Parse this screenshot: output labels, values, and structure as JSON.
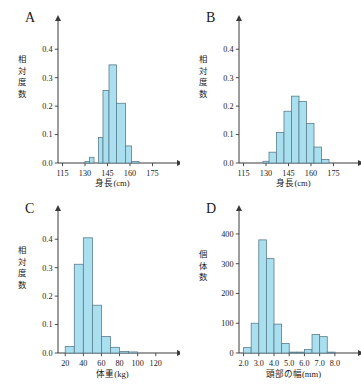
{
  "figure": {
    "background": "#ffffff",
    "bar_fill": "#aadff0",
    "bar_stroke": "#5b7d8c",
    "axis_color": "#3a3a3a"
  },
  "panels": [
    {
      "label": "A",
      "xlabel": "身長(cm)",
      "ylabel": "相対度数",
      "ylabel_chars": [
        "相",
        "対",
        "度",
        "数"
      ],
      "xticks": [
        "115",
        "130",
        "145",
        "160",
        "175"
      ],
      "yticks": [
        "0.0",
        "0.1",
        "0.2",
        "0.3",
        "0.4"
      ]
    },
    {
      "label": "B",
      "xlabel": "身長(cm)",
      "ylabel": "相対度数",
      "ylabel_chars": [
        "相",
        "対",
        "度",
        "数"
      ],
      "xticks": [
        "115",
        "130",
        "145",
        "160",
        "175"
      ],
      "yticks": [
        "0.0",
        "0.1",
        "0.2",
        "0.3",
        "0.4"
      ]
    },
    {
      "label": "C",
      "xlabel": "体重(kg)",
      "ylabel": "相対度数",
      "ylabel_chars": [
        "相",
        "対",
        "度",
        "数"
      ],
      "xticks": [
        "20",
        "40",
        "60",
        "80",
        "100",
        "120"
      ],
      "yticks": [
        "0.0",
        "0.1",
        "0.2",
        "0.3",
        "0.4"
      ]
    },
    {
      "label": "D",
      "xlabel": "頭部の幅(mm)",
      "ylabel": "個体数",
      "ylabel_chars": [
        "個",
        "体",
        "数"
      ],
      "xticks": [
        "2.0",
        "3.0",
        "4.0",
        "5.0",
        "6.0",
        "7.0",
        "8.0"
      ],
      "yticks": [
        "0",
        "100",
        "200",
        "300",
        "400"
      ]
    }
  ],
  "chart_data": [
    {
      "type": "bar",
      "panel": "A",
      "title": "A",
      "xlabel": "身長(cm)",
      "ylabel": "相対度数",
      "xlim": [
        112,
        182
      ],
      "ylim": [
        0,
        0.45
      ],
      "xticks": [
        115,
        130,
        145,
        160,
        175
      ],
      "yticks": [
        0.0,
        0.1,
        0.2,
        0.3,
        0.4
      ],
      "bin_width": 3,
      "bin_edges": [
        130,
        133,
        136,
        139,
        142,
        145,
        148,
        151,
        154,
        157,
        160,
        163,
        166
      ],
      "categories": [
        "130-133",
        "133-136",
        "136-139",
        "139-142",
        "142-145",
        "145-148",
        "148-151",
        "151-154",
        "154-157",
        "157-160",
        "160-163",
        "163-166"
      ],
      "values": [
        0.005,
        0.02,
        0.0,
        0.0,
        0.09,
        0.255,
        0.0,
        0.345,
        0.0,
        0.21,
        0.06,
        0.005
      ],
      "bars": [
        {
          "x0": 130,
          "x1": 133,
          "h": 0.005
        },
        {
          "x0": 133,
          "x1": 136,
          "h": 0.02
        },
        {
          "x0": 139,
          "x1": 142,
          "h": 0.09
        },
        {
          "x0": 142,
          "x1": 146,
          "h": 0.255
        },
        {
          "x0": 146,
          "x1": 151,
          "h": 0.345
        },
        {
          "x0": 151,
          "x1": 157,
          "h": 0.21
        },
        {
          "x0": 157,
          "x1": 161,
          "h": 0.06
        },
        {
          "x0": 161,
          "x1": 166,
          "h": 0.005
        }
      ],
      "grid": false,
      "legend": "none"
    },
    {
      "type": "bar",
      "panel": "B",
      "title": "B",
      "xlabel": "身長(cm)",
      "ylabel": "相対度数",
      "xlim": [
        112,
        182
      ],
      "ylim": [
        0,
        0.45
      ],
      "xticks": [
        115,
        130,
        145,
        160,
        175
      ],
      "yticks": [
        0.0,
        0.1,
        0.2,
        0.3,
        0.4
      ],
      "bin_width": 4,
      "categories": [
        "128-132",
        "132-136",
        "136-140",
        "140-144",
        "144-148",
        "148-152",
        "152-156",
        "156-160",
        "160-164",
        "164-168",
        "168-172"
      ],
      "values": [
        0.005,
        0.038,
        0.107,
        0.182,
        0.235,
        0.216,
        0.139,
        0.056,
        0.012,
        0.0,
        0.0
      ],
      "bars": [
        {
          "x0": 128,
          "x1": 132,
          "h": 0.006
        },
        {
          "x0": 132,
          "x1": 137,
          "h": 0.038
        },
        {
          "x0": 137,
          "x1": 142,
          "h": 0.107
        },
        {
          "x0": 142,
          "x1": 147,
          "h": 0.182
        },
        {
          "x0": 147,
          "x1": 152,
          "h": 0.235
        },
        {
          "x0": 152,
          "x1": 157,
          "h": 0.216
        },
        {
          "x0": 157,
          "x1": 162,
          "h": 0.139
        },
        {
          "x0": 162,
          "x1": 167,
          "h": 0.056
        },
        {
          "x0": 167,
          "x1": 172,
          "h": 0.012
        }
      ],
      "grid": false,
      "legend": "none"
    },
    {
      "type": "bar",
      "panel": "C",
      "title": "C",
      "xlabel": "体重(kg)",
      "ylabel": "相対度数",
      "xlim": [
        12,
        128
      ],
      "ylim": [
        0,
        0.45
      ],
      "xticks": [
        20,
        40,
        60,
        80,
        100,
        120
      ],
      "yticks": [
        0.0,
        0.1,
        0.2,
        0.3,
        0.4
      ],
      "bin_width": 10,
      "categories": [
        "20-30",
        "30-40",
        "40-50",
        "50-60",
        "60-70",
        "70-80",
        "80-90",
        "90-100"
      ],
      "values": [
        0.023,
        0.312,
        0.405,
        0.168,
        0.058,
        0.02,
        0.005,
        0.002
      ],
      "bars": [
        {
          "x0": 20,
          "x1": 30,
          "h": 0.023
        },
        {
          "x0": 30,
          "x1": 40,
          "h": 0.312
        },
        {
          "x0": 40,
          "x1": 50,
          "h": 0.405
        },
        {
          "x0": 50,
          "x1": 60,
          "h": 0.168
        },
        {
          "x0": 60,
          "x1": 70,
          "h": 0.058
        },
        {
          "x0": 70,
          "x1": 80,
          "h": 0.02
        },
        {
          "x0": 80,
          "x1": 90,
          "h": 0.005
        },
        {
          "x0": 90,
          "x1": 100,
          "h": 0.002
        }
      ],
      "grid": false,
      "legend": "none"
    },
    {
      "type": "bar",
      "panel": "D",
      "title": "D",
      "xlabel": "頭部の幅(mm)",
      "ylabel": "個体数",
      "xlim": [
        1.7,
        8.6
      ],
      "ylim": [
        0,
        430
      ],
      "xticks": [
        2.0,
        3.0,
        4.0,
        5.0,
        6.0,
        7.0,
        8.0
      ],
      "yticks": [
        0,
        100,
        200,
        300,
        400
      ],
      "bin_width": 0.5,
      "categories": [
        "2.0-2.5",
        "2.5-3.0",
        "3.0-3.5",
        "3.5-4.0",
        "4.0-4.5",
        "4.5-5.0",
        "5.0-5.5",
        "5.5-6.0",
        "6.0-6.5",
        "6.5-7.0",
        "7.0-7.5",
        "7.5-8.0"
      ],
      "values": [
        18,
        100,
        380,
        317,
        97,
        32,
        3,
        3,
        12,
        62,
        55,
        3
      ],
      "bars": [
        {
          "x0": 2.0,
          "x1": 2.5,
          "h": 18
        },
        {
          "x0": 2.5,
          "x1": 3.0,
          "h": 100
        },
        {
          "x0": 3.0,
          "x1": 3.5,
          "h": 380
        },
        {
          "x0": 3.5,
          "x1": 4.0,
          "h": 317
        },
        {
          "x0": 4.0,
          "x1": 4.5,
          "h": 97
        },
        {
          "x0": 4.5,
          "x1": 5.0,
          "h": 32
        },
        {
          "x0": 5.0,
          "x1": 5.5,
          "h": 3
        },
        {
          "x0": 5.5,
          "x1": 6.0,
          "h": 3
        },
        {
          "x0": 6.0,
          "x1": 6.5,
          "h": 12
        },
        {
          "x0": 6.5,
          "x1": 7.0,
          "h": 62
        },
        {
          "x0": 7.0,
          "x1": 7.5,
          "h": 55
        },
        {
          "x0": 7.5,
          "x1": 8.0,
          "h": 3
        }
      ],
      "grid": false,
      "legend": "none"
    }
  ]
}
